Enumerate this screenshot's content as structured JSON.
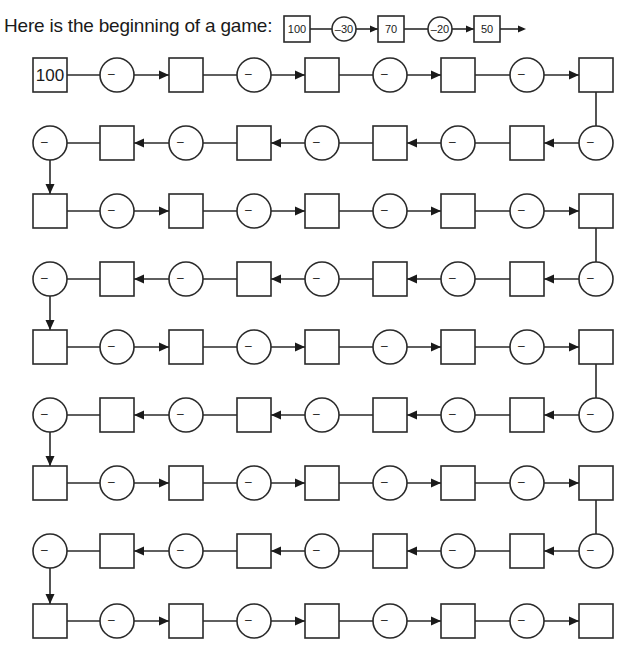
{
  "intro": {
    "text": "Here is the beginning of a game:",
    "example_chain": [
      {
        "type": "square",
        "value": "100"
      },
      {
        "type": "circle",
        "value": "-30"
      },
      {
        "type": "square",
        "value": "70"
      },
      {
        "type": "circle",
        "value": "-20"
      },
      {
        "type": "square",
        "value": "50"
      }
    ]
  },
  "board": {
    "start_value": "100",
    "circle_label": "–",
    "rows": 9,
    "nodes_per_row": 9,
    "row_pattern": [
      [
        "square",
        "circle",
        "square",
        "circle",
        "square",
        "circle",
        "square",
        "circle",
        "square"
      ],
      [
        "circle",
        "square",
        "circle",
        "square",
        "circle",
        "square",
        "circle",
        "square",
        "circle"
      ],
      [
        "square",
        "circle",
        "square",
        "circle",
        "square",
        "circle",
        "square",
        "circle",
        "square"
      ],
      [
        "circle",
        "square",
        "circle",
        "square",
        "circle",
        "square",
        "circle",
        "square",
        "circle"
      ],
      [
        "square",
        "circle",
        "square",
        "circle",
        "square",
        "circle",
        "square",
        "circle",
        "square"
      ],
      [
        "circle",
        "square",
        "circle",
        "square",
        "circle",
        "square",
        "circle",
        "square",
        "circle"
      ],
      [
        "square",
        "circle",
        "square",
        "circle",
        "square",
        "circle",
        "square",
        "circle",
        "square"
      ],
      [
        "circle",
        "square",
        "circle",
        "square",
        "circle",
        "square",
        "circle",
        "square",
        "circle"
      ],
      [
        "square",
        "circle",
        "square",
        "circle",
        "square",
        "circle",
        "square",
        "circle",
        "square"
      ]
    ],
    "row_direction": [
      "right",
      "left",
      "right",
      "left",
      "right",
      "left",
      "right",
      "left",
      "right"
    ]
  }
}
